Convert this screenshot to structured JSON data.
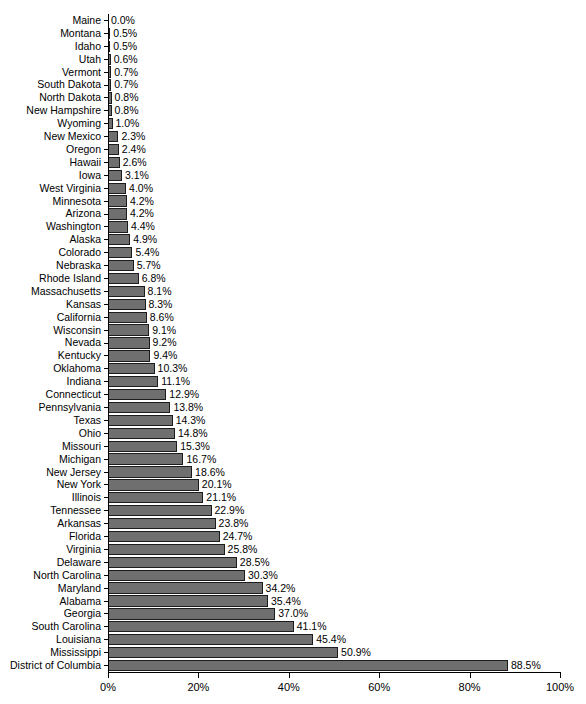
{
  "chart_data": {
    "type": "bar",
    "orientation": "horizontal",
    "title": "",
    "subtitle": "",
    "xlabel": "",
    "ylabel": "",
    "xlim": [
      0,
      100
    ],
    "grid": false,
    "legend": null,
    "x_tick_labels": [
      "0%",
      "20%",
      "40%",
      "60%",
      "80%",
      "100%"
    ],
    "x_tick_values": [
      0,
      20,
      40,
      60,
      80,
      100
    ],
    "value_suffix": "%",
    "bar_color": "#6f6f6f",
    "bar_edge_color": "#1c1c1c",
    "categories": [
      "Maine",
      "Montana",
      "Idaho",
      "Utah",
      "Vermont",
      "South Dakota",
      "North Dakota",
      "New Hampshire",
      "Wyoming",
      "New Mexico",
      "Oregon",
      "Hawaii",
      "Iowa",
      "West Virginia",
      "Minnesota",
      "Arizona",
      "Washington",
      "Alaska",
      "Colorado",
      "Nebraska",
      "Rhode Island",
      "Massachusetts",
      "Kansas",
      "California",
      "Wisconsin",
      "Nevada",
      "Kentucky",
      "Oklahoma",
      "Indiana",
      "Connecticut",
      "Pennsylvania",
      "Texas",
      "Ohio",
      "Missouri",
      "Michigan",
      "New Jersey",
      "New York",
      "Illinois",
      "Tennessee",
      "Arkansas",
      "Florida",
      "Virginia",
      "Delaware",
      "North Carolina",
      "Maryland",
      "Alabama",
      "Georgia",
      "South Carolina",
      "Louisiana",
      "Mississippi",
      "District of Columbia"
    ],
    "values": [
      0.0,
      0.5,
      0.5,
      0.6,
      0.7,
      0.7,
      0.8,
      0.8,
      1.0,
      2.3,
      2.4,
      2.6,
      3.1,
      4.0,
      4.2,
      4.2,
      4.4,
      4.9,
      5.4,
      5.7,
      6.8,
      8.1,
      8.3,
      8.6,
      9.1,
      9.2,
      9.4,
      10.3,
      11.1,
      12.9,
      13.8,
      14.3,
      14.8,
      15.3,
      16.7,
      18.6,
      20.1,
      21.1,
      22.9,
      23.8,
      24.7,
      25.8,
      28.5,
      30.3,
      34.2,
      35.4,
      37.0,
      41.1,
      45.4,
      50.9,
      88.5
    ],
    "value_labels": [
      "0.0%",
      "0.5%",
      "0.5%",
      "0.6%",
      "0.7%",
      "0.7%",
      "0.8%",
      "0.8%",
      "1.0%",
      "2.3%",
      "2.4%",
      "2.6%",
      "3.1%",
      "4.0%",
      "4.2%",
      "4.2%",
      "4.4%",
      "4.9%",
      "5.4%",
      "5.7%",
      "6.8%",
      "8.1%",
      "8.3%",
      "8.6%",
      "9.1%",
      "9.2%",
      "9.4%",
      "10.3%",
      "11.1%",
      "12.9%",
      "13.8%",
      "14.3%",
      "14.8%",
      "15.3%",
      "16.7%",
      "18.6%",
      "20.1%",
      "21.1%",
      "22.9%",
      "23.8%",
      "24.7%",
      "25.8%",
      "28.5%",
      "30.3%",
      "34.2%",
      "35.4%",
      "37.0%",
      "41.1%",
      "45.4%",
      "50.9%",
      "88.5%"
    ]
  }
}
